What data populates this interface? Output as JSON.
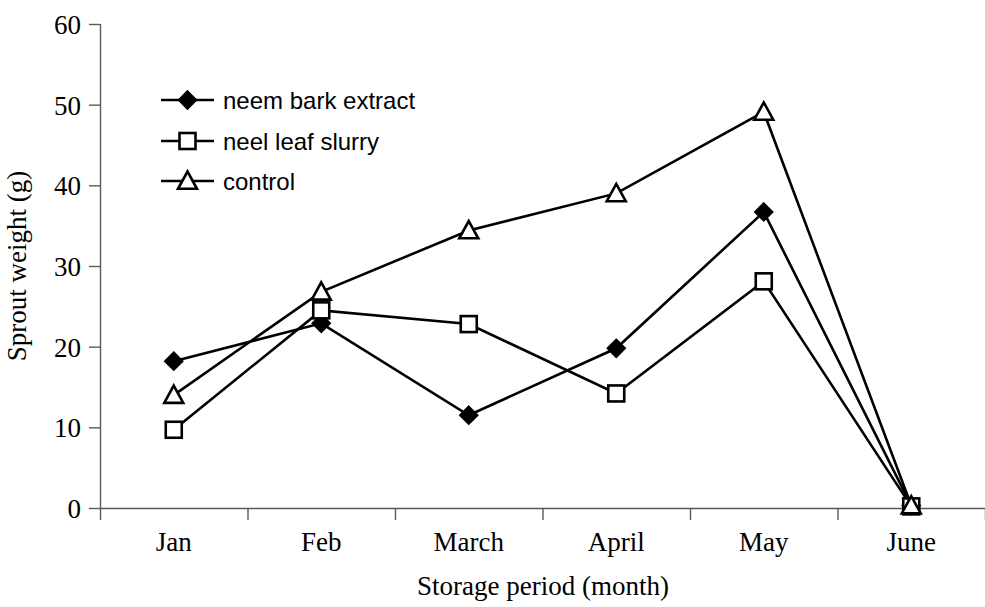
{
  "chart_data": {
    "type": "line",
    "title": "",
    "xlabel": "Storage period (month)",
    "ylabel": "Sprout weight (g)",
    "categories": [
      "Jan",
      "Feb",
      "March",
      "April",
      "May",
      "June"
    ],
    "ylim": [
      0,
      60
    ],
    "yticks": [
      0,
      10,
      20,
      30,
      40,
      50,
      60
    ],
    "ytick_labels": [
      "0",
      "10",
      "20",
      "30",
      "40",
      "50",
      "60"
    ],
    "grid": false,
    "legend_position": "upper-left-inside",
    "series": [
      {
        "name": "neem bark extract",
        "marker": "filled-diamond",
        "values": [
          18.2,
          22.9,
          11.5,
          19.8,
          36.7,
          0.3
        ]
      },
      {
        "name": "neel leaf slurry",
        "marker": "hollow-square",
        "values": [
          9.7,
          24.5,
          22.8,
          14.2,
          28.1,
          0.2
        ]
      },
      {
        "name": "control",
        "marker": "hollow-triangle",
        "values": [
          14.0,
          26.8,
          34.4,
          39.0,
          49.1,
          0.3
        ]
      }
    ],
    "colors": {
      "line": "#000000",
      "axis": "#5a5a5a",
      "background": "#ffffff"
    }
  }
}
